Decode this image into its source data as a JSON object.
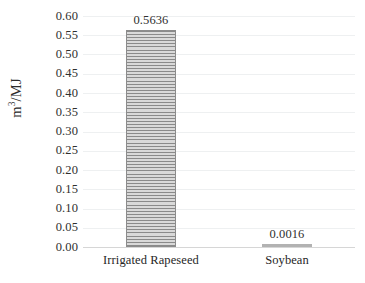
{
  "chart_data": {
    "type": "bar",
    "title": "",
    "subtitle": "",
    "xlabel": "",
    "ylabel": "m3/MJ",
    "ylabel_parts": {
      "base": "m",
      "sup": "3",
      "tail": "/MJ"
    },
    "categories": [
      "Irrigated Rapeseed",
      "Soybean"
    ],
    "values": [
      0.5636,
      0.0016
    ],
    "data_labels": [
      "0.5636",
      "0.0016"
    ],
    "ylim": [
      0.0,
      0.6
    ],
    "ytick_step": 0.05,
    "ytick_labels": [
      "0.60",
      "0.55",
      "0.50",
      "0.45",
      "0.40",
      "0.35",
      "0.30",
      "0.25",
      "0.20",
      "0.15",
      "0.10",
      "0.05",
      "0.00"
    ],
    "grid": true,
    "grid_axis": "y",
    "legend": false,
    "legend_position": "none",
    "series": [
      {
        "name": "Water footprint",
        "values": [
          0.5636,
          0.0016
        ]
      }
    ],
    "colors": {
      "bar_fill": "#dcdcdc",
      "bar_hatch_line": "#8a8a8a",
      "bar_border": "#8c8c8c",
      "gridline": "#eef0f1",
      "baseline": "#d6d6d6",
      "text": "#2f2f2f",
      "background": "#ffffff"
    }
  }
}
